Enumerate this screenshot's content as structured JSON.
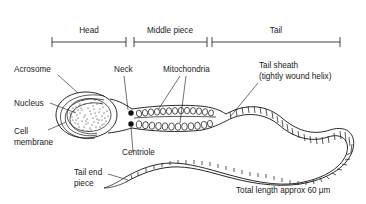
{
  "figure": {
    "background_color": "#ffffff",
    "ink_color": "#111111"
  },
  "scale_bars": [
    {
      "id": "head",
      "label": "Head",
      "x_start": 52,
      "x_end": 126,
      "y": 42,
      "label_x": 89,
      "label_y": 33
    },
    {
      "id": "middle-piece",
      "label": "Middle piece",
      "x_start": 134,
      "x_end": 207,
      "y": 42,
      "label_x": 170,
      "label_y": 33
    },
    {
      "id": "tail",
      "label": "Tail",
      "x_start": 212,
      "x_end": 340,
      "y": 42,
      "label_x": 276,
      "label_y": 33
    }
  ],
  "labels": [
    {
      "id": "acrosome",
      "text": "Acrosome",
      "x": 14,
      "y": 72,
      "anchor": "start"
    },
    {
      "id": "nucleus",
      "text": "Nucleus",
      "x": 14,
      "y": 106,
      "anchor": "start"
    },
    {
      "id": "cell-membrane-line1",
      "text": "Cell",
      "x": 14,
      "y": 134,
      "anchor": "start"
    },
    {
      "id": "cell-membrane-line2",
      "text": "membrane",
      "x": 14,
      "y": 145,
      "anchor": "start"
    },
    {
      "id": "neck",
      "text": "Neck",
      "x": 114,
      "y": 72,
      "anchor": "start"
    },
    {
      "id": "mitochondria",
      "text": "Mitochondria",
      "x": 163,
      "y": 72,
      "anchor": "start"
    },
    {
      "id": "centriole",
      "text": "Centriole",
      "x": 122,
      "y": 155,
      "anchor": "start"
    },
    {
      "id": "tail-sheath-line1",
      "text": "Tail sheath",
      "x": 259,
      "y": 68,
      "anchor": "start"
    },
    {
      "id": "tail-sheath-line2",
      "text": "(tightly wound helix)",
      "x": 259,
      "y": 79,
      "anchor": "start"
    },
    {
      "id": "tail-end-piece-line1",
      "text": "Tail end",
      "x": 74,
      "y": 175,
      "anchor": "start"
    },
    {
      "id": "tail-end-piece-line2",
      "text": "piece",
      "x": 74,
      "y": 186,
      "anchor": "start"
    }
  ],
  "annotations": {
    "total_length": "Total length approx 60 μm",
    "total_length_x": 236,
    "total_length_y": 193
  },
  "structures": {
    "head": {
      "center_x": 86,
      "center_y": 115,
      "rx": 28,
      "ry": 22
    },
    "nucleus": {
      "center_x": 88,
      "center_y": 115,
      "rx": 22,
      "ry": 16.5
    },
    "centrioles": [
      {
        "cx": 131,
        "cy": 114,
        "r": 2.6
      },
      {
        "cx": 131,
        "cy": 124,
        "r": 2.6
      }
    ],
    "mitochondria_rows": 2
  }
}
